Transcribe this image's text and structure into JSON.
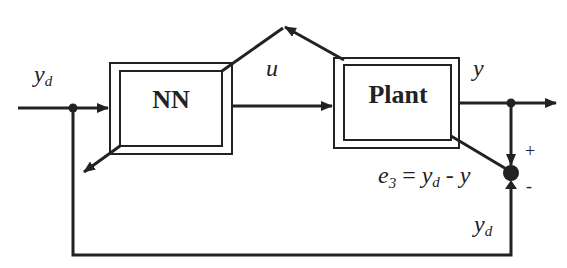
{
  "diagram": {
    "type": "control-block-diagram",
    "blocks": [
      {
        "id": "nn",
        "label": "NN"
      },
      {
        "id": "plant",
        "label": "Plant"
      }
    ],
    "signals": {
      "input": {
        "main": "y",
        "sub": "d"
      },
      "control": "u",
      "output": "y",
      "feedback": {
        "main": "y",
        "sub": "d"
      }
    },
    "error_equation": {
      "e": "e",
      "e_sub": "3",
      "equals": " = ",
      "yd_main": "y",
      "yd_sub": "d",
      "minus": " - ",
      "y": "y"
    },
    "summing_signs": {
      "plus": "+",
      "minus": "-"
    },
    "colors": {
      "stroke": "#222222",
      "background": "#ffffff"
    }
  }
}
